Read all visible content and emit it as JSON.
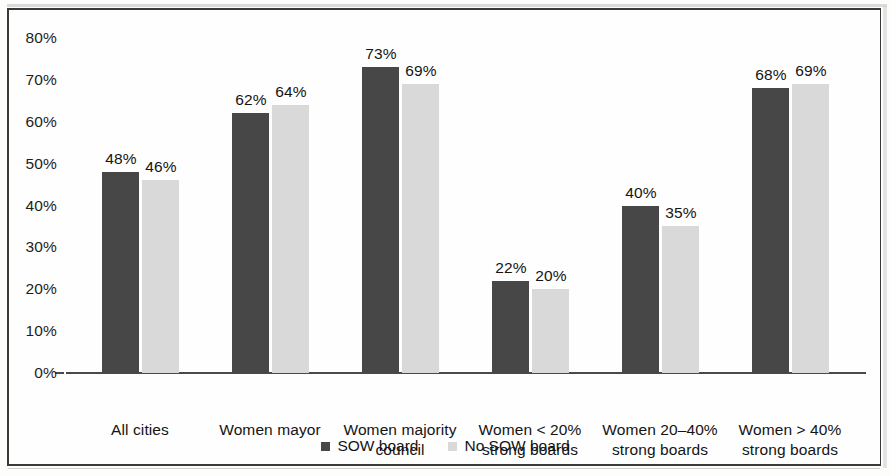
{
  "chart_data": {
    "type": "bar",
    "title": "",
    "subtitle": "",
    "xlabel": "",
    "ylabel": "",
    "ylim": [
      0,
      80
    ],
    "yticks": [
      "0%",
      "10%",
      "20%",
      "30%",
      "40%",
      "50%",
      "60%",
      "70%",
      "80%"
    ],
    "ytick_values": [
      0,
      10,
      20,
      30,
      40,
      50,
      60,
      70,
      80
    ],
    "grid": false,
    "legend_position": "bottom",
    "value_format": "percent",
    "categories": [
      {
        "line1": "All cities",
        "line2": ""
      },
      {
        "line1": "Women mayor",
        "line2": ""
      },
      {
        "line1": "Women majority",
        "line2": "council"
      },
      {
        "line1": "Women < 20%",
        "line2": "strong boards"
      },
      {
        "line1": "Women 20–40%",
        "line2": "strong boards"
      },
      {
        "line1": "Women > 40%",
        "line2": "strong boards"
      }
    ],
    "series": [
      {
        "name": "SOW board",
        "color": "#474747",
        "values": [
          48,
          62,
          73,
          22,
          40,
          68
        ],
        "labels": [
          "48%",
          "62%",
          "73%",
          "22%",
          "40%",
          "68%"
        ]
      },
      {
        "name": "No SOW board",
        "color": "#d9d9d9",
        "values": [
          46,
          64,
          69,
          20,
          35,
          69
        ],
        "labels": [
          "46%",
          "64%",
          "69%",
          "20%",
          "35%",
          "69%"
        ]
      }
    ]
  }
}
